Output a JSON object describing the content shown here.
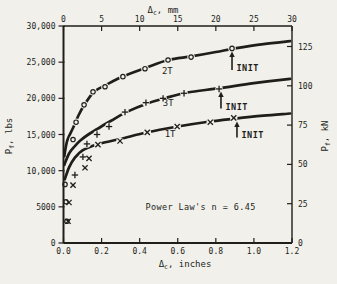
{
  "figure": {
    "background": "#f2f0eb",
    "ink": "#211e1a"
  },
  "chart_data": {
    "type": "line",
    "title": "",
    "grid": false,
    "legend_position": "inline-labels",
    "axes": {
      "bottom": {
        "title": {
          "sym": "Δ",
          "sub": "c",
          "rest": ", inches"
        },
        "max": 1.2,
        "range": [
          0,
          1.2
        ],
        "ticks": [
          {
            "v": 0,
            "label": "0.0"
          },
          {
            "v": 0.2,
            "label": "0.2"
          },
          {
            "v": 0.4,
            "label": "0.4"
          },
          {
            "v": 0.6,
            "label": "0.6"
          },
          {
            "v": 0.8,
            "label": "0.8"
          },
          {
            "v": 1.0,
            "label": "1.0"
          },
          {
            "v": 1.2,
            "label": "1.2"
          }
        ]
      },
      "top": {
        "title": {
          "sym": "Δ",
          "sub": "c",
          "rest": ", mm"
        },
        "max": 30,
        "range": [
          0,
          30
        ],
        "ticks": [
          {
            "v": 0,
            "label": "0"
          },
          {
            "v": 5,
            "label": "5"
          },
          {
            "v": 10,
            "label": "10"
          },
          {
            "v": 15,
            "label": "15"
          },
          {
            "v": 20,
            "label": "20"
          },
          {
            "v": 25,
            "label": "25"
          },
          {
            "v": 30,
            "label": "30"
          }
        ]
      },
      "left": {
        "title": {
          "sym": "P",
          "sub": "f",
          "rest": ", lbs"
        },
        "max": 30000,
        "range": [
          0,
          30000
        ],
        "ticks": [
          {
            "v": 30000,
            "label": "30,000"
          },
          {
            "v": 25000,
            "label": "25,000"
          },
          {
            "v": 20000,
            "label": "20,000"
          },
          {
            "v": 15000,
            "label": "15,000"
          },
          {
            "v": 10000,
            "label": "10,000"
          },
          {
            "v": 5000,
            "label": "5000"
          },
          {
            "v": 0,
            "label": "0"
          }
        ]
      },
      "right": {
        "title": {
          "sym": "P",
          "sub": "f",
          "rest": ", kN"
        },
        "max": 125,
        "range": [
          0,
          125
        ],
        "ticks": [
          {
            "v": 125,
            "label": "125"
          },
          {
            "v": 100,
            "label": "100"
          },
          {
            "v": 75,
            "label": "75"
          },
          {
            "v": 50,
            "label": "50"
          },
          {
            "v": 25,
            "label": "25"
          },
          {
            "v": 0,
            "label": "0"
          }
        ]
      }
    },
    "series": [
      {
        "name": "2T",
        "marker": "circle",
        "label_at": [
          0.545,
          23800
        ],
        "points": [
          [
            0.008,
            8100
          ],
          [
            0.013,
            5700
          ],
          [
            0.018,
            3000
          ],
          [
            0.05,
            14300
          ],
          [
            0.066,
            16700
          ],
          [
            0.108,
            19100
          ],
          [
            0.155,
            20900
          ],
          [
            0.218,
            21600
          ],
          [
            0.312,
            23000
          ],
          [
            0.428,
            24100
          ],
          [
            0.549,
            25300
          ],
          [
            0.67,
            25700
          ],
          [
            0.885,
            26900
          ]
        ],
        "curve": [
          [
            0.004,
            12000
          ],
          [
            0.02,
            14200
          ],
          [
            0.05,
            15900
          ],
          [
            0.08,
            17700
          ],
          [
            0.11,
            19100
          ],
          [
            0.16,
            20900
          ],
          [
            0.22,
            21800
          ],
          [
            0.31,
            23000
          ],
          [
            0.43,
            24200
          ],
          [
            0.55,
            25300
          ],
          [
            0.67,
            25800
          ],
          [
            0.8,
            26400
          ],
          [
            0.9,
            26900
          ],
          [
            1.05,
            27500
          ],
          [
            1.19,
            27900
          ]
        ]
      },
      {
        "name": "3T",
        "marker": "plus",
        "label_at": [
          0.55,
          19350
        ],
        "points": [
          [
            0.06,
            9400
          ],
          [
            0.102,
            11900
          ],
          [
            0.123,
            13700
          ],
          [
            0.176,
            15000
          ],
          [
            0.239,
            16100
          ],
          [
            0.323,
            18100
          ],
          [
            0.433,
            19400
          ],
          [
            0.523,
            20000
          ],
          [
            0.633,
            20700
          ],
          [
            0.817,
            21300
          ]
        ],
        "curve": [
          [
            0.004,
            10800
          ],
          [
            0.03,
            12400
          ],
          [
            0.06,
            13400
          ],
          [
            0.09,
            14200
          ],
          [
            0.13,
            15000
          ],
          [
            0.18,
            15800
          ],
          [
            0.25,
            16900
          ],
          [
            0.33,
            18100
          ],
          [
            0.44,
            19300
          ],
          [
            0.53,
            20000
          ],
          [
            0.65,
            20800
          ],
          [
            0.82,
            21400
          ],
          [
            1.0,
            22100
          ],
          [
            1.19,
            22700
          ]
        ]
      },
      {
        "name": "1T",
        "marker": "x",
        "label_at": [
          0.56,
          15050
        ],
        "points": [
          [
            0.05,
            8000
          ],
          [
            0.029,
            5600
          ],
          [
            0.024,
            3000
          ],
          [
            0.113,
            10400
          ],
          [
            0.134,
            11700
          ],
          [
            0.181,
            13600
          ],
          [
            0.297,
            14100
          ],
          [
            0.44,
            15300
          ],
          [
            0.597,
            16100
          ],
          [
            0.771,
            16700
          ],
          [
            0.894,
            17300
          ]
        ],
        "curve": [
          [
            0.004,
            8600
          ],
          [
            0.03,
            10500
          ],
          [
            0.06,
            11800
          ],
          [
            0.1,
            12800
          ],
          [
            0.15,
            13400
          ],
          [
            0.2,
            13800
          ],
          [
            0.3,
            14400
          ],
          [
            0.44,
            15300
          ],
          [
            0.6,
            16100
          ],
          [
            0.77,
            16800
          ],
          [
            0.9,
            17200
          ],
          [
            1.05,
            17600
          ],
          [
            1.19,
            17900
          ]
        ]
      }
    ],
    "annotations": {
      "init": [
        {
          "text": "INIT",
          "x": 0.885,
          "tip": 26350,
          "tail": 23900
        },
        {
          "text": "INIT",
          "x": 0.827,
          "tip": 20800,
          "tail": 18600
        },
        {
          "text": "INIT",
          "x": 0.911,
          "tip": 16650,
          "tail": 14600
        }
      ],
      "note": {
        "text": "Power Law's n = 6.45",
        "x": 0.72,
        "y": 4600
      }
    }
  }
}
